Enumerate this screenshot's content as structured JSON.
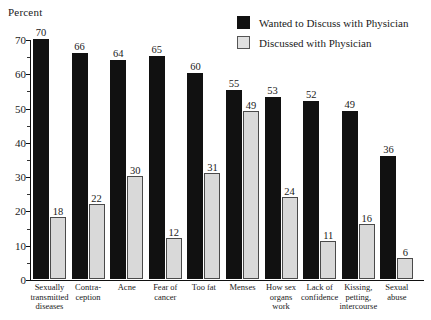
{
  "percent_axis_label": "Percent",
  "legend": {
    "position": "top-right",
    "entries": [
      {
        "label": "Wanted to Discuss with Physician",
        "swatch": "dark-square-icon",
        "color": "#111111"
      },
      {
        "label": "Discussed with Physician",
        "swatch": "light-square-icon",
        "color": "#e0e0e0"
      }
    ]
  },
  "chart_data": {
    "type": "bar",
    "title": "",
    "xlabel": "",
    "ylabel": "Percent",
    "ylim": [
      0,
      70
    ],
    "yticks": [
      0,
      10,
      20,
      30,
      40,
      50,
      60,
      70
    ],
    "grid": false,
    "categories": [
      "Sexually transmitted diseases",
      "Contra-ception",
      "Acne",
      "Fear of cancer",
      "Too fat",
      "Menses",
      "How sex organs work",
      "Lack of confidence",
      "Kissing, petting, intercourse",
      "Sexual abuse"
    ],
    "category_lines": [
      [
        "Sexually",
        "transmitted",
        "diseases"
      ],
      [
        "Contra-",
        "ception"
      ],
      [
        "Acne"
      ],
      [
        "Fear of",
        "cancer"
      ],
      [
        "Too fat"
      ],
      [
        "Menses"
      ],
      [
        "How sex",
        "organs",
        "work"
      ],
      [
        "Lack of",
        "confidence"
      ],
      [
        "Kissing,",
        "petting,",
        "intercourse"
      ],
      [
        "Sexual",
        "abuse"
      ]
    ],
    "series": [
      {
        "name": "Wanted to Discuss with Physician",
        "color": "#111111",
        "values": [
          70,
          66,
          64,
          65,
          60,
          55,
          53,
          52,
          49,
          36
        ]
      },
      {
        "name": "Discussed with Physician",
        "color": "#e0e0e0",
        "values": [
          18,
          22,
          30,
          12,
          31,
          49,
          24,
          11,
          16,
          6
        ]
      }
    ]
  }
}
